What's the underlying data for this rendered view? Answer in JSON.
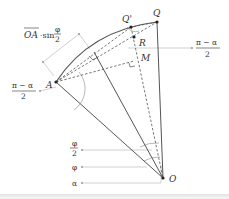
{
  "points": {
    "O": "O",
    "A": "A",
    "Q": "Q",
    "Q_prime": "Q'",
    "R": "R",
    "M": "M"
  },
  "annotations": {
    "chord_label_prefix": "OA",
    "chord_label_mid": "·sin",
    "phi": "φ",
    "two": "2",
    "pi_minus_alpha": "π − α",
    "alpha": "α"
  },
  "colors": {
    "line": "#555555",
    "helper": "#bbbbbb",
    "text": "#333333"
  }
}
